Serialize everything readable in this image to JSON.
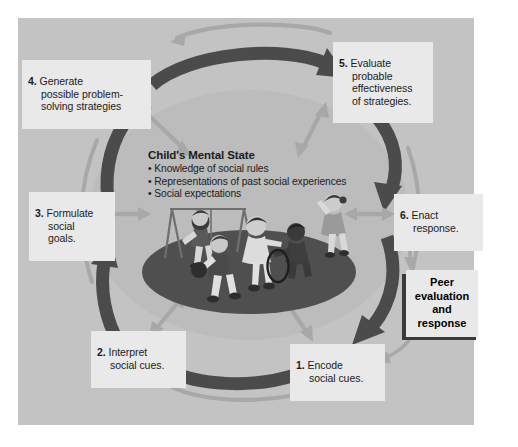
{
  "figure": {
    "panel_background": "#c3c3c3",
    "label_background": "#e9e9e9",
    "dark_arrow_color": "#4a4a4a",
    "light_arrow_color": "#a9a9a9",
    "ground_color": "#4f4f4f",
    "oval_color": "#bebebe"
  },
  "center": {
    "title": "Child's Mental State",
    "bullets": [
      "Knowledge of social rules",
      "Representations of past social experiences",
      "Social expectations"
    ]
  },
  "steps": [
    {
      "id": "step-1",
      "number": "1.",
      "text": "Encode\nsocial cues."
    },
    {
      "id": "step-2",
      "number": "2.",
      "text": "Interpret\nsocial cues."
    },
    {
      "id": "step-3",
      "number": "3.",
      "text": "Formulate\nsocial\ngoals."
    },
    {
      "id": "step-4",
      "number": "4.",
      "text": "Generate\npossible problem-\nsolving strategies"
    },
    {
      "id": "step-5",
      "number": "5.",
      "text": "Evaluate\nprobable\neffectiveness\nof strategies."
    },
    {
      "id": "step-6",
      "number": "6.",
      "text": "Enact\nresponse."
    }
  ],
  "outcome": {
    "label": "Peer\nevaluation\nand\nresponse"
  },
  "scene": {
    "name": "playground-illustration",
    "elements": [
      "swing-set",
      "child-on-swing",
      "child-with-ball",
      "child-standing",
      "child-seated",
      "hula-hoop",
      "child-waving"
    ]
  }
}
